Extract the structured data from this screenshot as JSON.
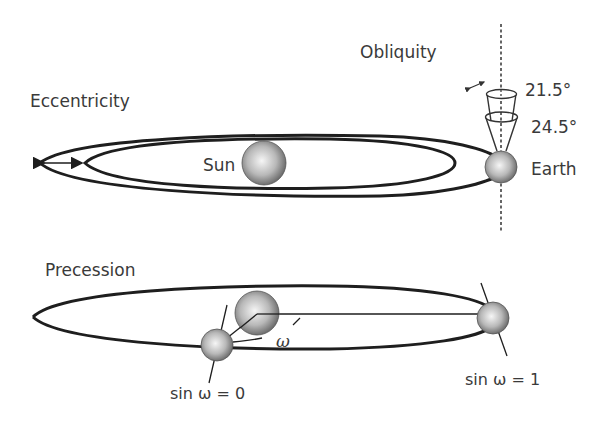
{
  "diagram": {
    "panels": {
      "top": {
        "labels": {
          "eccentricity": "Eccentricity",
          "obliquity": "Obliquity",
          "sun": "Sun",
          "earth": "Earth",
          "tilt_min": "21.5°",
          "tilt_max": "24.5°"
        }
      },
      "bottom": {
        "labels": {
          "precession": "Precession",
          "omega": "ω",
          "sin_zero": "sin ω = 0",
          "sin_one": "sin ω = 1"
        }
      }
    },
    "colors": {
      "line": "#1e1e1e",
      "text": "#3a3a3a",
      "sphere_light": "#f4f4f4",
      "sphere_dark": "#6a6a6a",
      "background": "#ffffff"
    }
  }
}
